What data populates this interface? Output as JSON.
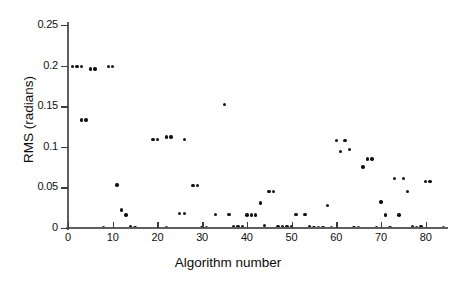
{
  "chart_data": {
    "type": "scatter",
    "title": "",
    "xlabel": "Algorithm number",
    "ylabel": "RMS (radians)",
    "xlim": [
      0,
      85
    ],
    "ylim": [
      0,
      0.25
    ],
    "grid": false,
    "legend": "none",
    "marker": "filled-circle",
    "marker_color": "#121212",
    "x_ticks": [
      0,
      10,
      20,
      30,
      40,
      50,
      60,
      70,
      80
    ],
    "x_tick_labels": [
      "0",
      "10",
      "20",
      "30",
      "40",
      "50",
      "60",
      "70",
      "80"
    ],
    "y_ticks": [
      0,
      0.05,
      0.1,
      0.15,
      0.2,
      0.25
    ],
    "y_tick_labels": [
      "0",
      "0.05",
      "0.1",
      "0.15",
      "0.2",
      "0.25"
    ],
    "series": [
      {
        "name": "RMS per algorithm",
        "x": [
          1,
          2,
          3,
          5,
          6,
          9,
          10,
          3,
          4,
          8,
          11,
          12,
          13,
          14,
          15,
          19,
          20,
          22,
          23,
          26,
          22,
          25,
          26,
          28,
          29,
          30,
          31,
          33,
          35,
          36,
          37,
          38,
          39,
          40,
          41,
          42,
          43,
          44,
          45,
          46,
          47,
          48,
          49,
          50,
          51,
          53,
          54,
          55,
          56,
          57,
          58,
          59,
          60,
          61,
          62,
          63,
          64,
          65,
          66,
          67,
          68,
          69,
          70,
          71,
          72,
          73,
          74,
          75,
          76,
          77,
          78,
          79,
          80,
          81,
          84
        ],
        "y": [
          0.199,
          0.199,
          0.199,
          0.196,
          0.196,
          0.199,
          0.199,
          0.133,
          0.133,
          0.001,
          0.053,
          0.022,
          0.016,
          0.002,
          0.001,
          0.109,
          0.109,
          0.112,
          0.112,
          0.109,
          0.001,
          0.018,
          0.018,
          0.052,
          0.052,
          0.001,
          0.001,
          0.017,
          0.152,
          0.017,
          0.002,
          0.002,
          0.002,
          0.016,
          0.016,
          0.016,
          0.031,
          0.003,
          0.045,
          0.045,
          0.002,
          0.002,
          0.002,
          0.002,
          0.017,
          0.017,
          0.002,
          0.001,
          0.001,
          0.001,
          0.028,
          0.001,
          0.108,
          0.094,
          0.108,
          0.097,
          0.001,
          0.001,
          0.075,
          0.085,
          0.085,
          0.001,
          0.032,
          0.016,
          0.001,
          0.061,
          0.016,
          0.061,
          0.045,
          0.002,
          0.001,
          0.002,
          0.057,
          0.057,
          0.001
        ]
      }
    ]
  },
  "axes": {
    "x_title": "Algorithm number",
    "y_title": "RMS (radians)"
  }
}
